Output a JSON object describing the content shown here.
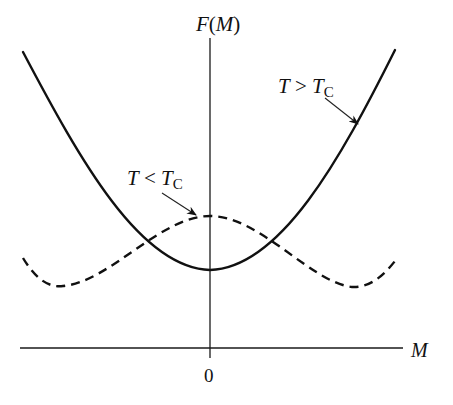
{
  "diagram": {
    "type": "free-energy-landau",
    "y_axis": {
      "label_F": "F",
      "label_open": "(",
      "label_M": "M",
      "label_close": ")"
    },
    "x_axis": {
      "label": "M",
      "origin_tick": "0"
    },
    "curves": [
      {
        "id": "above-tc",
        "style": "solid",
        "label_T": "T",
        "label_op": " > ",
        "label_Tc": "T",
        "label_sub": "C",
        "shape": "single-well parabola, minimum at M=0"
      },
      {
        "id": "below-tc",
        "style": "dashed",
        "label_T": "T",
        "label_op": " < ",
        "label_Tc": "T",
        "label_sub": "C",
        "shape": "double-well, local maximum at M=0, minima at ±M0"
      }
    ]
  }
}
